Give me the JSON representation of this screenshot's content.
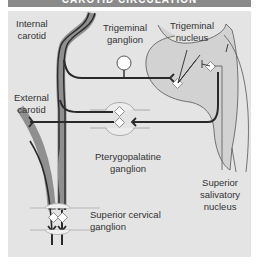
{
  "title": "CAROTID CIRCULATION",
  "labels": {
    "internal_carotid": [
      "Internal",
      "carotid"
    ],
    "trigeminal_ganglion": [
      "Trigeminal",
      "ganglion"
    ],
    "trigeminal_nucleus": [
      "Trigeminal",
      "nucleus"
    ],
    "external_carotid": [
      "External",
      "carotid"
    ],
    "pterygopalatine_ganglion": [
      "Pterygopalatine",
      "ganglion"
    ],
    "superior_salivatory_nucleus": [
      "Superior",
      "salivatory",
      "nucleus"
    ],
    "superior_cervical_ganglion": [
      "Superior cervical",
      "ganglion"
    ]
  },
  "colors": {
    "panel_bg": "#e4e4e4",
    "vessel": "#8f8f8f",
    "nerve": "#2a2a2a",
    "brainstem": "#d2d2d2",
    "title_bar": "#8a8a8a"
  }
}
